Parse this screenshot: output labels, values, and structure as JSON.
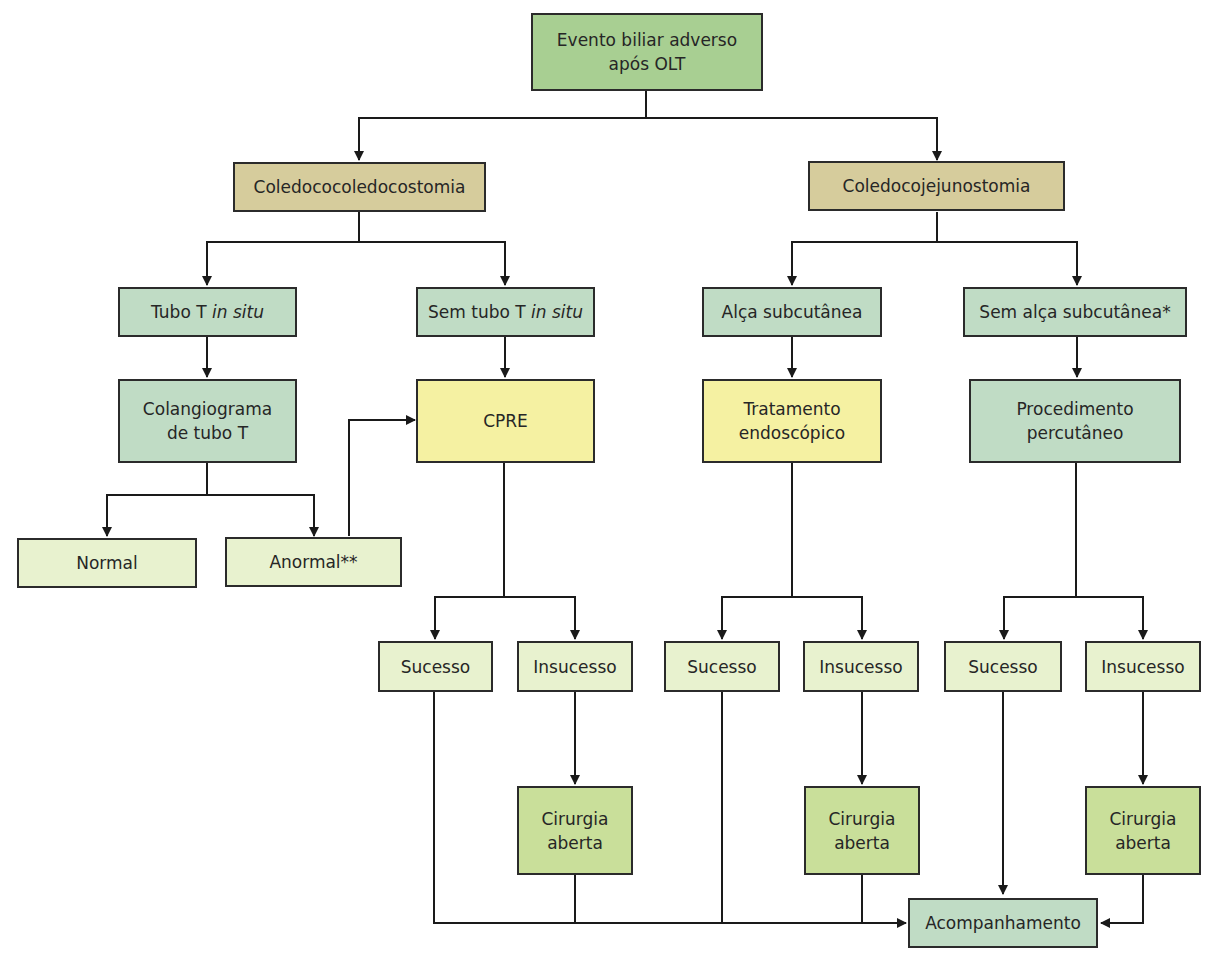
{
  "colors": {
    "root": "#a8cf92",
    "procedure_type": "#d6cc9c",
    "condition": "#c0dcc5",
    "endoscopic": "#f5f1a2",
    "outcome": "#e8f2cf",
    "surgery": "#c9df9a",
    "line": "#1a1a1a"
  },
  "nodes": {
    "root": {
      "line1": "Evento biliar adverso",
      "line2": "após OLT"
    },
    "duct_to_duct": {
      "label": "Coledococoledocostomia"
    },
    "roux": {
      "label": "Coledocojejunostomia"
    },
    "t_tube": {
      "pre": "Tubo T ",
      "italic": "in situ"
    },
    "no_t_tube": {
      "pre": "Sem tubo T ",
      "italic": "in situ"
    },
    "subcut_loop": {
      "label": "Alça subcutânea"
    },
    "no_subcut_loop": {
      "label": "Sem alça subcutânea*"
    },
    "t_tube_chol": {
      "line1": "Colangiograma",
      "line2": "de tubo T"
    },
    "ercp": {
      "label": "CPRE"
    },
    "endo_tx": {
      "line1": "Tratamento",
      "line2": "endoscópico"
    },
    "percutaneous": {
      "line1": "Procedimento",
      "line2": "percutâneo"
    },
    "normal": {
      "label": "Normal"
    },
    "abnormal": {
      "label": "Anormal**"
    },
    "success_1": {
      "label": "Sucesso"
    },
    "failure_1": {
      "label": "Insucesso"
    },
    "success_2": {
      "label": "Sucesso"
    },
    "failure_2": {
      "label": "Insucesso"
    },
    "success_3": {
      "label": "Sucesso"
    },
    "failure_3": {
      "label": "Insucesso"
    },
    "surgery_1": {
      "line1": "Cirurgia",
      "line2": "aberta"
    },
    "surgery_2": {
      "line1": "Cirurgia",
      "line2": "aberta"
    },
    "surgery_3": {
      "line1": "Cirurgia",
      "line2": "aberta"
    },
    "follow_up": {
      "label": "Acompanhamento"
    }
  }
}
